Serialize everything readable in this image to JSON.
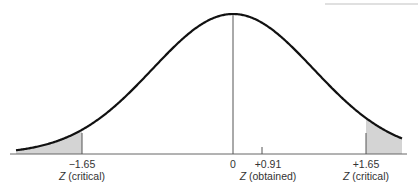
{
  "diagram": {
    "type": "normal-distribution",
    "colors": {
      "curve": "#111111",
      "axis": "#666666",
      "shade": "#d4d4d4",
      "text": "#333333"
    },
    "ticks": [
      {
        "id": "left-critical",
        "value": "−1.65",
        "caption_var": "Z",
        "caption_text": "(critical)"
      },
      {
        "id": "mean",
        "value": "0"
      },
      {
        "id": "obtained",
        "value": "+0.91",
        "caption_var": "Z",
        "caption_text": "(obtained)"
      },
      {
        "id": "right-critical",
        "value": "+1.65",
        "caption_var": "Z",
        "caption_text": "(critical)"
      }
    ]
  }
}
